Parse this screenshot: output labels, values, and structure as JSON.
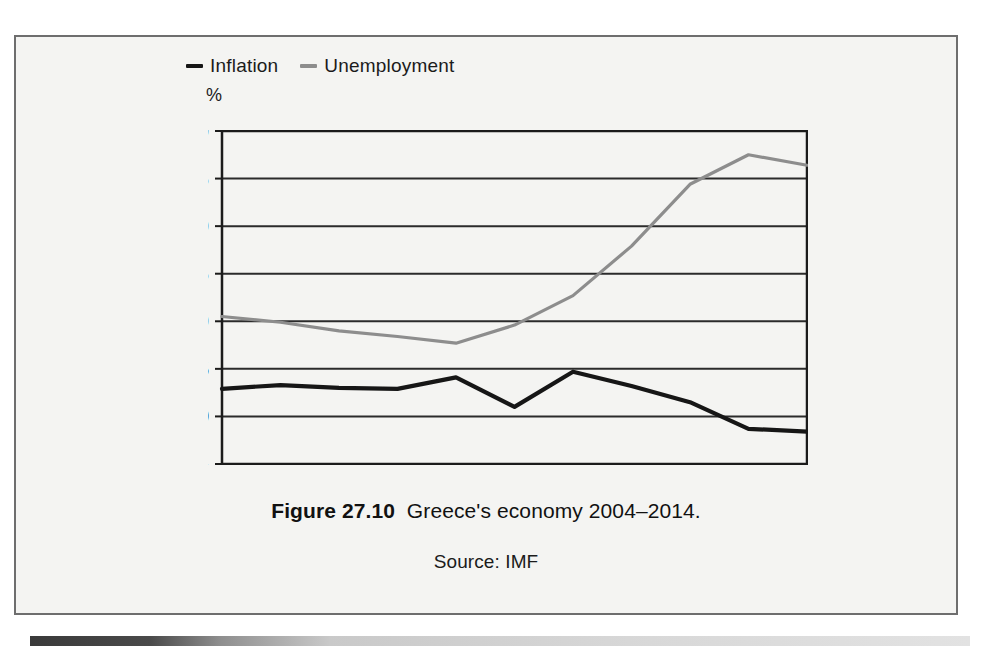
{
  "figure": {
    "caption_label": "Figure 27.10",
    "caption_text": "Greece's economy 2004–2014.",
    "source": "Source: IMF"
  },
  "colors": {
    "inflation": "#161616",
    "unemployment": "#8d8d8d",
    "axis": "#1b1b1b",
    "grid": "#2b2b2b",
    "frame_border": "#6e6e6e",
    "panel_background": "#f4f4f2"
  },
  "chart_data": {
    "type": "line",
    "title": "Greece's economy 2004–2014",
    "xlabel": "",
    "ylabel": "%",
    "y_unit": "%",
    "categories": [
      "2004",
      "05",
      "06",
      "07",
      "08",
      "09",
      "2010",
      "11",
      "12",
      "13",
      "2014"
    ],
    "x": [
      2004,
      2005,
      2006,
      2007,
      2008,
      2009,
      2010,
      2011,
      2012,
      2013,
      2014
    ],
    "xlim": [
      2004,
      2014
    ],
    "ylim": [
      -5,
      30
    ],
    "yticks": [
      30,
      25,
      20,
      15,
      10,
      5,
      0,
      -5
    ],
    "ytick_labels": [
      "30",
      "25",
      "20",
      "15",
      "10",
      "5",
      "0",
      "−5"
    ],
    "grid": true,
    "legend_position": "above-plot-left",
    "series": [
      {
        "name": "Inflation",
        "color": "#161616",
        "values": [
          2.9,
          3.3,
          3.0,
          2.9,
          4.1,
          1.0,
          4.7,
          3.2,
          1.5,
          -1.3,
          -1.6
        ]
      },
      {
        "name": "Unemployment",
        "color": "#8d8d8d",
        "values": [
          10.5,
          9.9,
          9.0,
          8.4,
          7.7,
          9.6,
          12.7,
          17.9,
          24.4,
          27.5,
          26.4
        ]
      }
    ]
  }
}
